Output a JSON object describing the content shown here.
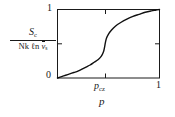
{
  "figure": {
    "axis_color": "#1a1a1a",
    "curve_color": "#111111",
    "background": "#ffffff",
    "y_label": {
      "numerator_main": "S",
      "numerator_sub": "c",
      "denominator_prefix": "Nk ",
      "denominator_log": "ℓn ",
      "denominator_var": "v",
      "denominator_var_sub": "s"
    },
    "x_label": "p",
    "ticks": {
      "y_top": "1",
      "y_bottom": "0",
      "x_right": "1",
      "x_special_main": "p",
      "x_special_sub": "cz"
    }
  },
  "chart_data": {
    "type": "line",
    "title": "",
    "xlabel": "p",
    "ylabel": "S_c / (Nk ℓn v̄_s)",
    "xlim": [
      0,
      1
    ],
    "ylim": [
      0,
      1
    ],
    "grid": false,
    "legend": "none",
    "xticks": [
      0,
      0.47,
      1
    ],
    "xticklabels": [
      "",
      "p_cz",
      "1"
    ],
    "yticks": [
      0,
      0.5,
      1
    ],
    "yticklabels": [
      "0",
      "",
      "1"
    ],
    "annotations": [
      {
        "text": "p_cz",
        "x": 0.47,
        "y": 0,
        "note": "critical percolation point tick on x-axis"
      }
    ],
    "series": [
      {
        "name": "configurational entropy",
        "x": [
          0.0,
          0.04,
          0.08,
          0.12,
          0.16,
          0.2,
          0.24,
          0.28,
          0.32,
          0.36,
          0.4,
          0.43,
          0.45,
          0.46,
          0.47,
          0.48,
          0.5,
          0.53,
          0.57,
          0.62,
          0.68,
          0.74,
          0.8,
          0.86,
          0.92,
          0.96,
          1.0
        ],
        "y": [
          0.0,
          0.02,
          0.04,
          0.06,
          0.08,
          0.1,
          0.13,
          0.16,
          0.19,
          0.23,
          0.27,
          0.32,
          0.38,
          0.44,
          0.52,
          0.58,
          0.64,
          0.7,
          0.76,
          0.81,
          0.86,
          0.9,
          0.93,
          0.96,
          0.98,
          0.99,
          1.0
        ]
      }
    ]
  }
}
